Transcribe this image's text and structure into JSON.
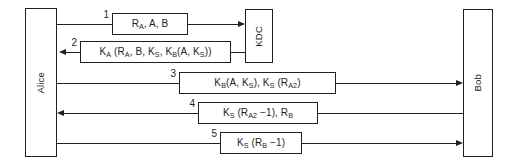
{
  "diagram": {
    "actors": [
      {
        "id": "alice",
        "label": "Alice"
      },
      {
        "id": "kdc",
        "label": "KDC"
      },
      {
        "id": "bob",
        "label": "Bob"
      }
    ],
    "messages": [
      {
        "number": "1",
        "from": "alice",
        "to": "kdc",
        "direction": "right",
        "text": "Rₐ, A, B",
        "parts": [
          {
            "t": "R",
            "sub": "A"
          },
          {
            "t": ", A, B"
          }
        ]
      },
      {
        "number": "2",
        "from": "kdc",
        "to": "alice",
        "direction": "left",
        "text": "Kₐ (Rₐ, B, Kₛ, Kʙ(A, Kₛ))",
        "parts": [
          {
            "t": "K",
            "sub": "A"
          },
          {
            "t": " (R",
            "sub": "A"
          },
          {
            "t": ", B, K",
            "sub": "S"
          },
          {
            "t": ", K",
            "sub": "B"
          },
          {
            "t": "(A, K",
            "sub": "S"
          },
          {
            "t": "))"
          }
        ]
      },
      {
        "number": "3",
        "from": "alice",
        "to": "bob",
        "direction": "right",
        "text": "Kʙ(A, Kₛ), Kₛ (Rₐ₂)",
        "parts": [
          {
            "t": "K",
            "sub": "B"
          },
          {
            "t": "(A, K",
            "sub": "S"
          },
          {
            "t": "), K",
            "sub": "S"
          },
          {
            "t": " (R",
            "sub": "A2"
          },
          {
            "t": ")"
          }
        ]
      },
      {
        "number": "4",
        "from": "bob",
        "to": "alice",
        "direction": "left",
        "text": "Kₛ (Rₐ₂ −1), Rʙ",
        "parts": [
          {
            "t": "K",
            "sub": "S"
          },
          {
            "t": " (R",
            "sub": "A2"
          },
          {
            "t": " −1), R",
            "sub": "B"
          },
          {
            "t": ""
          }
        ]
      },
      {
        "number": "5",
        "from": "alice",
        "to": "bob",
        "direction": "right",
        "text": "Kₛ (Rʙ −1)",
        "parts": [
          {
            "t": "K",
            "sub": "S"
          },
          {
            "t": " (R",
            "sub": "B"
          },
          {
            "t": " −1)"
          }
        ]
      }
    ],
    "colors": {
      "stroke": "#231f20",
      "background": "#ffffff"
    }
  }
}
